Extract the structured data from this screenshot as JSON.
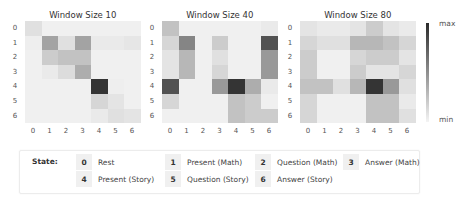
{
  "chart_data": [
    {
      "type": "heatmap",
      "title": "Window Size 10",
      "x_ticks": [
        "0",
        "1",
        "2",
        "3",
        "4",
        "5",
        "6"
      ],
      "y_ticks": [
        "0",
        "1",
        "2",
        "3",
        "4",
        "5",
        "6"
      ],
      "scale": [
        0,
        1
      ],
      "values": [
        [
          0.1,
          0.02,
          0.02,
          0.02,
          0.02,
          0.02,
          0.02
        ],
        [
          0.03,
          0.4,
          0.1,
          0.4,
          0.05,
          0.05,
          0.07
        ],
        [
          0.02,
          0.2,
          0.25,
          0.25,
          0.02,
          0.02,
          0.02
        ],
        [
          0.02,
          0.05,
          0.12,
          0.35,
          0.02,
          0.02,
          0.02
        ],
        [
          0.02,
          0.02,
          0.02,
          0.02,
          0.95,
          0.03,
          0.02
        ],
        [
          0.02,
          0.02,
          0.02,
          0.02,
          0.15,
          0.08,
          0.02
        ],
        [
          0.02,
          0.02,
          0.02,
          0.02,
          0.05,
          0.1,
          0.08
        ]
      ]
    },
    {
      "type": "heatmap",
      "title": "Window Size 40",
      "x_ticks": [
        "0",
        "1",
        "2",
        "3",
        "4",
        "5",
        "6"
      ],
      "y_ticks": [
        "0",
        "1",
        "2",
        "3",
        "4",
        "5",
        "6"
      ],
      "scale": [
        0,
        1
      ],
      "values": [
        [
          0.25,
          0.02,
          0.02,
          0.02,
          0.02,
          0.02,
          0.05
        ],
        [
          0.15,
          0.55,
          0.02,
          0.2,
          0.02,
          0.02,
          0.8
        ],
        [
          0.08,
          0.3,
          0.02,
          0.1,
          0.02,
          0.02,
          0.45
        ],
        [
          0.08,
          0.3,
          0.02,
          0.15,
          0.02,
          0.02,
          0.45
        ],
        [
          0.8,
          0.02,
          0.02,
          0.45,
          0.95,
          0.35,
          0.05
        ],
        [
          0.15,
          0.02,
          0.02,
          0.02,
          0.25,
          0.2,
          0.02
        ],
        [
          0.02,
          0.02,
          0.02,
          0.02,
          0.25,
          0.2,
          0.2
        ]
      ]
    },
    {
      "type": "heatmap",
      "title": "Window Size 80",
      "x_ticks": [
        "0",
        "1",
        "2",
        "3",
        "4",
        "5",
        "6"
      ],
      "y_ticks": [
        "0",
        "1",
        "2",
        "3",
        "4",
        "5",
        "6"
      ],
      "scale": [
        0,
        1
      ],
      "values": [
        [
          0.08,
          0.05,
          0.05,
          0.08,
          0.2,
          0.08,
          0.05
        ],
        [
          0.15,
          0.1,
          0.1,
          0.3,
          0.3,
          0.25,
          0.15
        ],
        [
          0.2,
          0.02,
          0.02,
          0.15,
          0.2,
          0.2,
          0.08
        ],
        [
          0.2,
          0.02,
          0.02,
          0.2,
          0.08,
          0.08,
          0.15
        ],
        [
          0.25,
          0.25,
          0.1,
          0.3,
          0.95,
          0.45,
          0.1
        ],
        [
          0.15,
          0.02,
          0.02,
          0.02,
          0.25,
          0.25,
          0.05
        ],
        [
          0.15,
          0.02,
          0.02,
          0.02,
          0.25,
          0.25,
          0.1
        ]
      ]
    }
  ],
  "colorbar": {
    "max_label": "max",
    "min_label": "min",
    "max_color": "#2a2a2a",
    "min_color": "#f4f4f4"
  },
  "legend": {
    "title": "State:",
    "items": [
      {
        "num": "0",
        "label": "Rest"
      },
      {
        "num": "1",
        "label": "Present (Math)"
      },
      {
        "num": "2",
        "label": "Question (Math)"
      },
      {
        "num": "3",
        "label": "Answer (Math)"
      },
      {
        "num": "4",
        "label": "Present (Story)"
      },
      {
        "num": "5",
        "label": "Question (Story)"
      },
      {
        "num": "6",
        "label": "Answer (Story)"
      }
    ]
  }
}
